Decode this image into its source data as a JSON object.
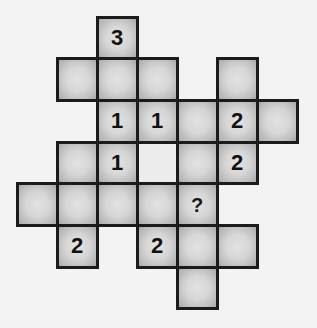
{
  "puzzle": {
    "type": "number-grid",
    "colors": {
      "background": "#f3f3f3",
      "cell_center": "#e2e2e2",
      "cell_edge": "#a9a9a9",
      "border": "#1b1b1b",
      "text": "#111111"
    },
    "grid": {
      "origin_x": 17,
      "origin_y": 17,
      "cell_w": 40,
      "cell_h": 41.7
    },
    "cells": [
      {
        "row": 0,
        "col": 2,
        "value": "3"
      },
      {
        "row": 1,
        "col": 1,
        "value": ""
      },
      {
        "row": 1,
        "col": 2,
        "value": ""
      },
      {
        "row": 1,
        "col": 3,
        "value": ""
      },
      {
        "row": 1,
        "col": 5,
        "value": ""
      },
      {
        "row": 2,
        "col": 2,
        "value": "1"
      },
      {
        "row": 2,
        "col": 3,
        "value": "1"
      },
      {
        "row": 2,
        "col": 4,
        "value": ""
      },
      {
        "row": 2,
        "col": 5,
        "value": "2"
      },
      {
        "row": 2,
        "col": 6,
        "value": ""
      },
      {
        "row": 3,
        "col": 1,
        "value": ""
      },
      {
        "row": 3,
        "col": 2,
        "value": "1"
      },
      {
        "row": 3,
        "col": 3,
        "value": "",
        "blank": true
      },
      {
        "row": 3,
        "col": 4,
        "value": ""
      },
      {
        "row": 3,
        "col": 5,
        "value": "2"
      },
      {
        "row": 4,
        "col": 0,
        "value": ""
      },
      {
        "row": 4,
        "col": 1,
        "value": ""
      },
      {
        "row": 4,
        "col": 2,
        "value": ""
      },
      {
        "row": 4,
        "col": 3,
        "value": ""
      },
      {
        "row": 4,
        "col": 4,
        "value": "?"
      },
      {
        "row": 5,
        "col": 1,
        "value": "2"
      },
      {
        "row": 5,
        "col": 3,
        "value": "2"
      },
      {
        "row": 5,
        "col": 4,
        "value": ""
      },
      {
        "row": 5,
        "col": 5,
        "value": ""
      },
      {
        "row": 6,
        "col": 4,
        "value": ""
      }
    ]
  }
}
